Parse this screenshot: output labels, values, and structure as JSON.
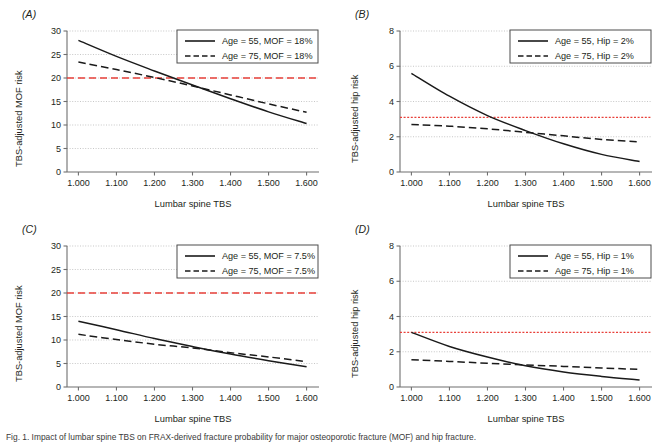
{
  "figure": {
    "panels": [
      {
        "key": "A",
        "label": "(A)",
        "ylabel": "TBS-adjusted MOF risk",
        "xlabel": "Lumbar spine TBS",
        "legend": [
          {
            "label": "Age = 55, MOF = 18%",
            "style": "solid"
          },
          {
            "label": "Age = 75, MOF = 18%",
            "style": "dashed"
          }
        ]
      },
      {
        "key": "B",
        "label": "(B)",
        "ylabel": "TBS-adjusted hip risk",
        "xlabel": "Lumbar spine TBS",
        "legend": [
          {
            "label": "Age = 55, Hip = 2%",
            "style": "solid"
          },
          {
            "label": "Age = 75, Hip = 2%",
            "style": "dashed"
          }
        ]
      },
      {
        "key": "C",
        "label": "(C)",
        "ylabel": "TBS-adjusted MOF risk",
        "xlabel": "Lumbar spine TBS",
        "legend": [
          {
            "label": "Age = 55, MOF = 7.5%",
            "style": "solid"
          },
          {
            "label": "Age = 75, MOF = 7.5%",
            "style": "dashed"
          }
        ]
      },
      {
        "key": "D",
        "label": "(D)",
        "ylabel": "TBS-adjusted hip risk",
        "xlabel": "Lumbar spine TBS",
        "legend": [
          {
            "label": "Age = 55, Hip = 1%",
            "style": "solid"
          },
          {
            "label": "Age = 75, Hip = 1%",
            "style": "dashed"
          }
        ]
      }
    ],
    "caption": "Fig. 1. Impact of lumbar spine TBS on FRAX-derived fracture probability for major osteoporotic fracture (MOF) and hip fracture."
  },
  "chart_data": [
    {
      "panel": "A",
      "type": "line",
      "title": "(A)",
      "xlabel": "Lumbar spine TBS",
      "ylabel": "TBS-adjusted MOF risk",
      "xlim": [
        0.97,
        1.63
      ],
      "ylim": [
        0,
        30
      ],
      "xticks": [
        "1.000",
        "1.100",
        "1.200",
        "1.300",
        "1.400",
        "1.500",
        "1.600"
      ],
      "xtick_values": [
        1.0,
        1.1,
        1.2,
        1.3,
        1.4,
        1.5,
        1.6
      ],
      "yticks": [
        "0",
        "5",
        "10",
        "15",
        "20",
        "25",
        "30"
      ],
      "ytick_values": [
        0,
        5,
        10,
        15,
        20,
        25,
        30
      ],
      "grid": "horizontal-dotted",
      "legend_position": "top-right",
      "threshold_line": {
        "value": 20,
        "color": "#e8403a",
        "style": "dashed",
        "label": "intervention threshold"
      },
      "x": [
        1.0,
        1.1,
        1.2,
        1.3,
        1.4,
        1.5,
        1.6
      ],
      "series": [
        {
          "name": "Age = 55, MOF = 18%",
          "style": "solid",
          "values": [
            28.0,
            24.6,
            21.5,
            18.5,
            15.6,
            12.8,
            10.3
          ]
        },
        {
          "name": "Age = 75, MOF = 18%",
          "style": "dashed",
          "values": [
            23.4,
            21.8,
            20.1,
            18.3,
            16.4,
            14.5,
            12.7
          ]
        }
      ]
    },
    {
      "panel": "B",
      "type": "line",
      "title": "(B)",
      "xlabel": "Lumbar spine TBS",
      "ylabel": "TBS-adjusted hip risk",
      "xlim": [
        0.97,
        1.63
      ],
      "ylim": [
        0,
        8
      ],
      "xticks": [
        "1.000",
        "1.100",
        "1.200",
        "1.300",
        "1.400",
        "1.500",
        "1.600"
      ],
      "xtick_values": [
        1.0,
        1.1,
        1.2,
        1.3,
        1.4,
        1.5,
        1.6
      ],
      "yticks": [
        "0",
        "2",
        "4",
        "6",
        "8"
      ],
      "ytick_values": [
        0,
        2,
        4,
        6,
        8
      ],
      "grid": "horizontal-dotted",
      "legend_position": "top-right",
      "threshold_line": {
        "value": 3.1,
        "color": "#e8403a",
        "style": "dotted",
        "label": "intervention threshold"
      },
      "x": [
        1.0,
        1.1,
        1.2,
        1.3,
        1.4,
        1.5,
        1.6
      ],
      "series": [
        {
          "name": "Age = 55, Hip = 2%",
          "style": "solid",
          "values": [
            5.6,
            4.3,
            3.2,
            2.35,
            1.6,
            1.0,
            0.6
          ]
        },
        {
          "name": "Age = 75, Hip = 2%",
          "style": "dashed",
          "values": [
            2.7,
            2.6,
            2.45,
            2.25,
            2.05,
            1.85,
            1.7
          ]
        }
      ]
    },
    {
      "panel": "C",
      "type": "line",
      "title": "(C)",
      "xlabel": "Lumbar spine TBS",
      "ylabel": "TBS-adjusted MOF risk",
      "xlim": [
        0.97,
        1.63
      ],
      "ylim": [
        0,
        30
      ],
      "xticks": [
        "1.000",
        "1.100",
        "1.200",
        "1.300",
        "1.400",
        "1.500",
        "1.600"
      ],
      "xtick_values": [
        1.0,
        1.1,
        1.2,
        1.3,
        1.4,
        1.5,
        1.6
      ],
      "yticks": [
        "0",
        "5",
        "10",
        "15",
        "20",
        "25",
        "30"
      ],
      "ytick_values": [
        0,
        5,
        10,
        15,
        20,
        25,
        30
      ],
      "grid": "horizontal-dotted",
      "legend_position": "top-right",
      "threshold_line": {
        "value": 20,
        "color": "#e8403a",
        "style": "dashed",
        "label": "intervention threshold"
      },
      "x": [
        1.0,
        1.1,
        1.2,
        1.3,
        1.4,
        1.5,
        1.6
      ],
      "series": [
        {
          "name": "Age = 55, MOF = 7.5%",
          "style": "solid",
          "values": [
            14.0,
            12.2,
            10.3,
            8.6,
            7.0,
            5.6,
            4.3
          ]
        },
        {
          "name": "Age = 75, MOF = 7.5%",
          "style": "dashed",
          "values": [
            11.2,
            10.1,
            9.1,
            8.3,
            7.3,
            6.4,
            5.4
          ]
        }
      ]
    },
    {
      "panel": "D",
      "type": "line",
      "title": "(D)",
      "xlabel": "Lumbar spine TBS",
      "ylabel": "TBS-adjusted hip risk",
      "xlim": [
        0.97,
        1.63
      ],
      "ylim": [
        0,
        8
      ],
      "xticks": [
        "1.000",
        "1.100",
        "1.200",
        "1.300",
        "1.400",
        "1.500",
        "1.600"
      ],
      "xtick_values": [
        1.0,
        1.1,
        1.2,
        1.3,
        1.4,
        1.5,
        1.6
      ],
      "yticks": [
        "0",
        "2",
        "4",
        "6",
        "8"
      ],
      "ytick_values": [
        0,
        2,
        4,
        6,
        8
      ],
      "grid": "horizontal-dotted",
      "legend_position": "top-right",
      "threshold_line": {
        "value": 3.1,
        "color": "#e8403a",
        "style": "dotted",
        "label": "intervention threshold"
      },
      "x": [
        1.0,
        1.1,
        1.2,
        1.3,
        1.4,
        1.5,
        1.6
      ],
      "series": [
        {
          "name": "Age = 55, Hip = 1%",
          "style": "solid",
          "values": [
            3.1,
            2.3,
            1.7,
            1.2,
            0.85,
            0.6,
            0.4
          ]
        },
        {
          "name": "Age = 75, Hip = 1%",
          "style": "dashed",
          "values": [
            1.55,
            1.45,
            1.35,
            1.25,
            1.17,
            1.08,
            1.0
          ]
        }
      ]
    }
  ]
}
